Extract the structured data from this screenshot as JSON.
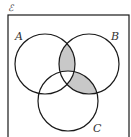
{
  "diagram": {
    "type": "venn",
    "universal_label": "ℰ",
    "sets": [
      {
        "id": "A",
        "label": "A"
      },
      {
        "id": "B",
        "label": "B"
      },
      {
        "id": "C",
        "label": "C"
      }
    ],
    "shaded_regions": [
      "A∩B∩C'",
      "B∩C∩A'"
    ],
    "colors": {
      "outline": "#1a1a1a",
      "shade": "#c8c8c8",
      "background": "#ffffff"
    }
  }
}
